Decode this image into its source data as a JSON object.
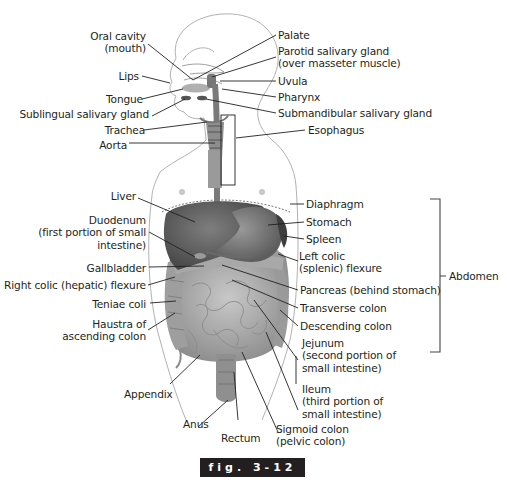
{
  "figure": {
    "caption": "fig. 3-12",
    "bracket_label": "Abdomen"
  },
  "labels_left": [
    {
      "id": "oral-cavity",
      "lines": [
        "Oral cavity",
        "(mouth)"
      ]
    },
    {
      "id": "lips",
      "lines": [
        "Lips"
      ]
    },
    {
      "id": "tongue",
      "lines": [
        "Tongue"
      ]
    },
    {
      "id": "sublingual",
      "lines": [
        "Sublingual salivary gland"
      ]
    },
    {
      "id": "trachea",
      "lines": [
        "Trachea"
      ]
    },
    {
      "id": "aorta",
      "lines": [
        "Aorta"
      ]
    },
    {
      "id": "liver",
      "lines": [
        "Liver"
      ]
    },
    {
      "id": "duodenum",
      "lines": [
        "Duodenum",
        "(first portion of small",
        "intestine)"
      ]
    },
    {
      "id": "gallbladder",
      "lines": [
        "Gallbladder"
      ]
    },
    {
      "id": "right-colic",
      "lines": [
        "Right colic (hepatic) flexure"
      ]
    },
    {
      "id": "teniae",
      "lines": [
        "Teniae coli"
      ]
    },
    {
      "id": "haustra",
      "lines": [
        "Haustra of",
        "ascending colon"
      ]
    },
    {
      "id": "appendix",
      "lines": [
        "Appendix"
      ]
    },
    {
      "id": "anus",
      "lines": [
        "Anus"
      ]
    },
    {
      "id": "rectum",
      "lines": [
        "Rectum"
      ]
    }
  ],
  "labels_right": [
    {
      "id": "palate",
      "lines": [
        "Palate"
      ]
    },
    {
      "id": "parotid",
      "lines": [
        "Parotid salivary gland",
        "(over masseter muscle)"
      ]
    },
    {
      "id": "uvula",
      "lines": [
        "Uvula"
      ]
    },
    {
      "id": "pharynx",
      "lines": [
        "Pharynx"
      ]
    },
    {
      "id": "submandibular",
      "lines": [
        "Submandibular salivary gland"
      ]
    },
    {
      "id": "esophagus",
      "lines": [
        "Esophagus"
      ]
    },
    {
      "id": "diaphragm",
      "lines": [
        "Diaphragm"
      ]
    },
    {
      "id": "stomach",
      "lines": [
        "Stomach"
      ]
    },
    {
      "id": "spleen",
      "lines": [
        "Spleen"
      ]
    },
    {
      "id": "left-colic",
      "lines": [
        "Left colic",
        "(splenic) flexure"
      ]
    },
    {
      "id": "pancreas",
      "lines": [
        "Pancreas (behind stomach)"
      ]
    },
    {
      "id": "transverse",
      "lines": [
        "Transverse colon"
      ]
    },
    {
      "id": "descending",
      "lines": [
        "Descending colon"
      ]
    },
    {
      "id": "jejunum",
      "lines": [
        "Jejunum",
        "(second portion of",
        "small intestine)"
      ]
    },
    {
      "id": "ileum",
      "lines": [
        "Ileum",
        "(third portion of",
        "small intestine)"
      ]
    },
    {
      "id": "sigmoid",
      "lines": [
        "Sigmoid colon",
        "(pelvic colon)"
      ]
    }
  ],
  "colors": {
    "line": "#231f20",
    "organ_dark": "#5a5a5a",
    "organ_mid": "#8a8a8a",
    "organ_light": "#b8b8b8",
    "outline": "#9a9a9a",
    "caption_bg": "#231f20"
  }
}
